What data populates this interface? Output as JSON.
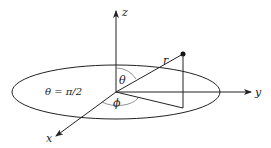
{
  "diagram": {
    "axes": {
      "x": {
        "label": "x"
      },
      "y": {
        "label": "y"
      },
      "z": {
        "label": "z"
      }
    },
    "radius_label": "r",
    "polar_angle_label": "θ",
    "azimuth_angle_label": "ϕ",
    "plane_equation": "θ = π/2",
    "colors": {
      "ink": "#222222",
      "background": "#ffffff"
    }
  }
}
